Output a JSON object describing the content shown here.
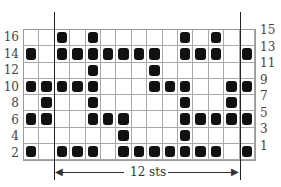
{
  "chart_data": {
    "type": "table",
    "columns": 15,
    "rows": [
      {
        "left_label": "16",
        "right_label": "15",
        "filled": [
          3,
          5,
          11,
          13
        ]
      },
      {
        "left_label": "14",
        "right_label": "13",
        "filled": [
          1,
          3,
          4,
          5,
          6,
          7,
          8,
          9,
          11,
          12,
          13,
          15
        ]
      },
      {
        "left_label": "12",
        "right_label": "11",
        "filled": [
          5,
          9
        ]
      },
      {
        "left_label": "10",
        "right_label": "9",
        "filled": [
          1,
          2,
          3,
          4,
          5,
          9,
          10,
          11,
          14,
          15
        ]
      },
      {
        "left_label": "8",
        "right_label": "7",
        "filled": [
          2,
          5,
          11,
          14
        ]
      },
      {
        "left_label": "6",
        "right_label": "5",
        "filled": [
          1,
          2,
          5,
          6,
          7,
          11,
          12,
          13,
          14,
          15
        ]
      },
      {
        "left_label": "4",
        "right_label": "3",
        "filled": [
          7,
          11
        ]
      },
      {
        "left_label": "2",
        "right_label": "1",
        "filled": [
          1,
          3,
          4,
          5,
          7,
          8,
          9,
          10,
          11,
          12,
          13,
          15
        ]
      }
    ],
    "repeat": {
      "label": "12 sts",
      "start_col": 3,
      "end_col": 14
    }
  },
  "colors": {
    "filled": "#111111",
    "grid": "#a8a8a8",
    "background": "#ffffff"
  }
}
